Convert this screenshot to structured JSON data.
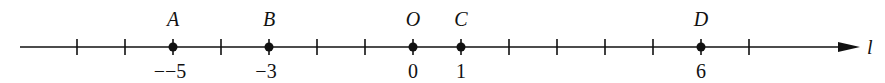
{
  "diagram": {
    "type": "number-line",
    "line_label": "l",
    "unit_px": 48,
    "origin_x": 413,
    "axis_y": 47,
    "line_start_x": 20,
    "line_end_x": 860,
    "tick_values": [
      -7,
      -6,
      -5,
      -4,
      -3,
      -2,
      -1,
      0,
      1,
      2,
      3,
      4,
      5,
      6,
      7
    ],
    "points": [
      {
        "name": "A",
        "value": -5,
        "value_label": "--5"
      },
      {
        "name": "B",
        "value": -3,
        "value_label": "-3"
      },
      {
        "name": "O",
        "value": 0,
        "value_label": "0"
      },
      {
        "name": "C",
        "value": 1,
        "value_label": "1"
      },
      {
        "name": "D",
        "value": 6,
        "value_label": "6"
      }
    ],
    "color": "#111111"
  }
}
